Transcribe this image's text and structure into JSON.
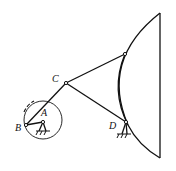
{
  "diagram": {
    "type": "linkage-mechanism",
    "labels": {
      "A": "A",
      "B": "B",
      "C": "C",
      "D": "D"
    },
    "colors": {
      "stroke": "#111111",
      "background": "#ffffff"
    }
  }
}
